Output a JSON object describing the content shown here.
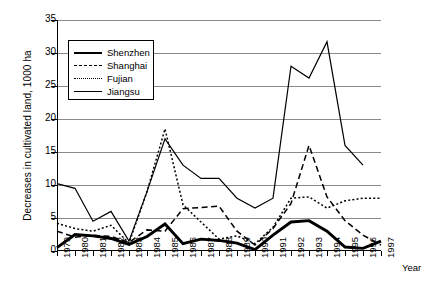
{
  "chart_data": {
    "type": "line",
    "title": "",
    "xlabel": "Year",
    "ylabel": "Decreases in cultivated land, 1000 ha",
    "xlim": [
      1979,
      1997
    ],
    "ylim": [
      0,
      35
    ],
    "ytick_labels": [
      "0",
      "5",
      "10",
      "15",
      "20",
      "25",
      "30",
      "35"
    ],
    "ytick_values": [
      0,
      5,
      10,
      15,
      20,
      25,
      30,
      35
    ],
    "grid": "horizontal",
    "legend_position": "upper-left-inside",
    "x": [
      1979,
      1980,
      1981,
      1982,
      1983,
      1984,
      1985,
      1986,
      1987,
      1988,
      1989,
      1990,
      1991,
      1992,
      1993,
      1994,
      1995,
      1996,
      1997
    ],
    "categories": [
      "1979",
      "1980",
      "1981",
      "1982",
      "1983",
      "1984",
      "1985",
      "1986",
      "1987",
      "1988",
      "1989",
      "1990",
      "1991",
      "1992",
      "1993",
      "1994",
      "1995",
      "1996",
      "1997"
    ],
    "series": [
      {
        "name": "Shenzhen",
        "style": "solid-thick",
        "values": [
          0.5,
          2.5,
          2.3,
          1.9,
          1.0,
          2.2,
          4.1,
          1.1,
          1.8,
          1.6,
          1.2,
          0.2,
          2.4,
          4.4,
          4.6,
          3.0,
          0.6,
          0.4,
          1.5
        ]
      },
      {
        "name": "Shanghai",
        "style": "dashed",
        "values": [
          3.0,
          2.1,
          2.4,
          2.2,
          1.3,
          3.2,
          3.0,
          6.4,
          6.6,
          6.8,
          3.0,
          0.9,
          3.4,
          7.2,
          16.0,
          8.2,
          4.6,
          2.4,
          0.9
        ]
      },
      {
        "name": "Fujian",
        "style": "dotted",
        "values": [
          4.2,
          3.4,
          3.0,
          3.9,
          1.2,
          9.0,
          18.5,
          7.0,
          4.4,
          1.8,
          2.3,
          1.1,
          3.6,
          8.0,
          8.2,
          6.5,
          7.6,
          8.0,
          8.0
        ]
      },
      {
        "name": "Jiangsu",
        "style": "solid",
        "values": [
          10.2,
          9.5,
          4.5,
          6.0,
          1.5,
          9.0,
          17.0,
          13.0,
          11.0,
          11.0,
          8.0,
          6.5,
          8.0,
          28.0,
          26.2,
          31.7,
          16.0,
          13.0,
          null
        ]
      }
    ]
  },
  "legend": {
    "items": [
      {
        "label": "Shenzhen"
      },
      {
        "label": "Shanghai"
      },
      {
        "label": "Fujian"
      },
      {
        "label": "Jiangsu"
      }
    ]
  },
  "axes": {
    "y_title": "Decreases in cultivated land, 1000 ha",
    "x_title": "Year"
  }
}
